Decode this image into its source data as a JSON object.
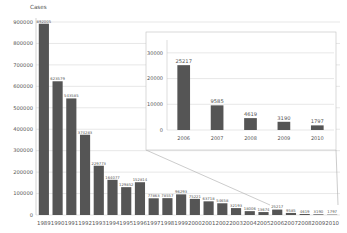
{
  "chart_data": [
    {
      "type": "bar",
      "title": "",
      "ylabel": "Cases",
      "xlabel": "",
      "categories": [
        "1989",
        "1990",
        "1991",
        "1992",
        "1993",
        "1994",
        "1995",
        "1996",
        "1997",
        "1998",
        "1999",
        "2000",
        "2001",
        "2002",
        "2003",
        "2004",
        "2005",
        "2006",
        "2007",
        "2008",
        "2009",
        "2010"
      ],
      "values": [
        892005,
        623579,
        543585,
        374283,
        229773,
        164077,
        129852,
        152814,
        77863,
        78557,
        96293,
        75221,
        63718,
        54658,
        32193,
        18006,
        13674,
        25217,
        9585,
        4619,
        3190,
        1797
      ],
      "value_labels": [
        "892005",
        "623579",
        "543585",
        "374283",
        "229773",
        "164077",
        "129852",
        "152814",
        "77863",
        "78557",
        "96293",
        "75221",
        "63718",
        "54658",
        "32193",
        "18006",
        "13674",
        "25217",
        "9585",
        "4619",
        "3190",
        "1797"
      ],
      "yticks": [
        0,
        100000,
        200000,
        300000,
        400000,
        500000,
        600000,
        700000,
        800000,
        900000
      ],
      "ytick_labels": [
        "0",
        "100000",
        "200000",
        "300000",
        "400000",
        "500000",
        "600000",
        "700000",
        "800000",
        "900000"
      ],
      "ylim": [
        0,
        900000
      ],
      "grid": true,
      "bar_color": "#555555"
    },
    {
      "type": "bar",
      "title": "",
      "inset": true,
      "categories": [
        "2006",
        "2007",
        "2008",
        "2009",
        "2010"
      ],
      "values": [
        25217,
        9585,
        4619,
        3190,
        1797
      ],
      "value_labels": [
        "25217",
        "9585",
        "4619",
        "3190",
        "1797"
      ],
      "yticks": [
        0,
        10000,
        20000,
        30000
      ],
      "ytick_labels": [
        "0",
        "10000",
        "20000",
        "30000"
      ],
      "ylim": [
        0,
        35000
      ],
      "grid": true,
      "bar_color": "#555555"
    }
  ],
  "labels": {
    "y_axis_title": "Cases"
  }
}
